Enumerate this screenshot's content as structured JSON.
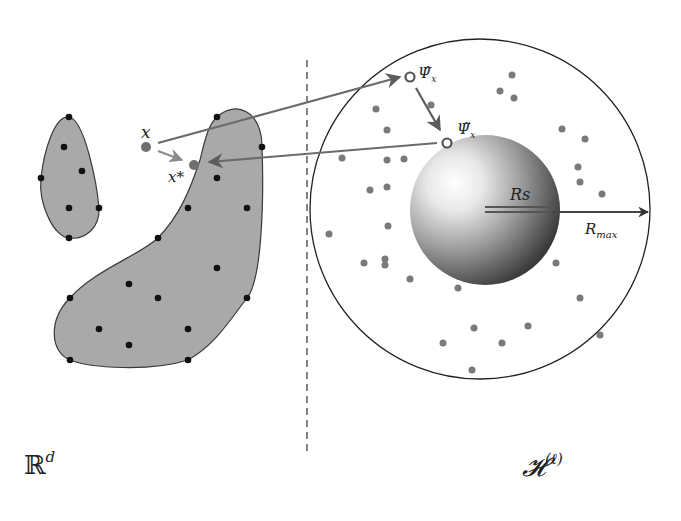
{
  "diagram": {
    "left_space": {
      "symbol": "ℝ",
      "superscript": "d"
    },
    "right_space": {
      "symbol": "𝓗",
      "superscript": "(ℓ)"
    },
    "labels": {
      "x": "x",
      "x_star": "x*",
      "psi_hat": "Ψ̂",
      "psi_hat_sub": "x",
      "psi_tilde": "Ψ̃",
      "psi_tilde_sub": "x",
      "rs": "Rs",
      "rmax": "R",
      "rmax_sub": "max"
    },
    "colors": {
      "blob_fill": "#a9a9a9",
      "blob_stroke": "#3a3a3a",
      "black_dot": "#111111",
      "gray_dot": "#7a7a7a",
      "arrow": "#6b6b6b",
      "circle": "#222222"
    },
    "small_blob_points": [
      [
        69,
        117
      ],
      [
        64,
        147
      ],
      [
        82,
        171
      ],
      [
        41,
        178
      ],
      [
        69,
        208
      ],
      [
        99,
        208
      ],
      [
        69,
        238
      ]
    ],
    "large_blob_points": [
      [
        217,
        117
      ],
      [
        262,
        147
      ],
      [
        217,
        178
      ],
      [
        188,
        208
      ],
      [
        247,
        208
      ],
      [
        158,
        238
      ],
      [
        217,
        268
      ],
      [
        129,
        284
      ],
      [
        70,
        298
      ],
      [
        158,
        298
      ],
      [
        247,
        298
      ],
      [
        99,
        329
      ],
      [
        188,
        329
      ],
      [
        129,
        345
      ],
      [
        70,
        360
      ],
      [
        188,
        360
      ]
    ],
    "feature_points": [
      [
        512,
        75
      ],
      [
        500,
        91
      ],
      [
        514,
        98
      ],
      [
        431,
        105
      ],
      [
        376,
        109
      ],
      [
        562,
        129
      ],
      [
        387,
        130
      ],
      [
        585,
        139
      ],
      [
        342,
        158
      ],
      [
        387,
        160
      ],
      [
        404,
        159
      ],
      [
        578,
        167
      ],
      [
        580,
        182
      ],
      [
        370,
        190
      ],
      [
        387,
        187
      ],
      [
        602,
        194
      ],
      [
        388,
        226
      ],
      [
        329,
        234
      ],
      [
        364,
        263
      ],
      [
        385,
        259
      ],
      [
        385,
        265
      ],
      [
        556,
        263
      ],
      [
        410,
        279
      ],
      [
        458,
        288
      ],
      [
        580,
        298
      ],
      [
        474,
        328
      ],
      [
        528,
        326
      ],
      [
        600,
        335
      ],
      [
        443,
        343
      ],
      [
        502,
        343
      ],
      [
        472,
        370
      ]
    ],
    "sphere": {
      "cx": 485,
      "cy": 210,
      "r": 75
    },
    "outer_circle": {
      "cx": 480,
      "cy": 209,
      "r": 170
    },
    "divider_x": 307
  }
}
